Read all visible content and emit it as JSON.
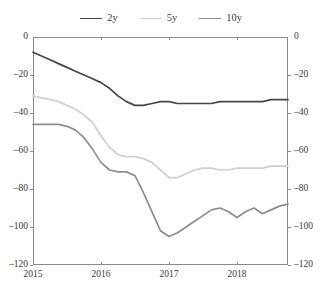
{
  "chart_data": {
    "type": "line",
    "title": "",
    "subtitle": "",
    "xlabel": "",
    "ylabel": "",
    "xlim": [
      2015.0,
      2018.75
    ],
    "ylim": [
      -120,
      0
    ],
    "yticks": [
      0,
      -20,
      -40,
      -60,
      -80,
      -100,
      -120
    ],
    "ytick_labels": [
      "0",
      "–20",
      "–40",
      "–60",
      "–80",
      "–100",
      "–120"
    ],
    "right_axis": true,
    "right_ytick_labels": [
      "0",
      "–20",
      "–40",
      "–60",
      "–80",
      "–100",
      "–120"
    ],
    "xticks": [
      2015,
      2016,
      2017,
      2018
    ],
    "xtick_labels": [
      "2015",
      "2016",
      "2017",
      "2018"
    ],
    "grid": false,
    "legend_position": "top-center",
    "x": [
      2015.0,
      2015.125,
      2015.25,
      2015.375,
      2015.5,
      2015.625,
      2015.75,
      2015.875,
      2016.0,
      2016.125,
      2016.25,
      2016.375,
      2016.5,
      2016.625,
      2016.75,
      2016.875,
      2017.0,
      2017.125,
      2017.25,
      2017.375,
      2017.5,
      2017.625,
      2017.75,
      2017.875,
      2018.0,
      2018.125,
      2018.25,
      2018.375,
      2018.5,
      2018.625,
      2018.75
    ],
    "series": [
      {
        "name": "2y",
        "color": "#474747",
        "width": 1.7,
        "values": [
          -8,
          -10,
          -12,
          -14,
          -16,
          -18,
          -20,
          -22,
          -24,
          -27,
          -31,
          -34,
          -36,
          -36,
          -35,
          -34,
          -34,
          -35,
          -35,
          -35,
          -35,
          -35,
          -34,
          -34,
          -34,
          -34,
          -34,
          -34,
          -33,
          -33,
          -33
        ]
      },
      {
        "name": "5y",
        "color": "#cfcfcf",
        "width": 1.7,
        "values": [
          -31,
          -32,
          -33,
          -34,
          -36,
          -38,
          -41,
          -45,
          -52,
          -58,
          -62,
          -63,
          -63,
          -64,
          -66,
          -70,
          -74,
          -74,
          -72,
          -70,
          -69,
          -69,
          -70,
          -70,
          -69,
          -69,
          -69,
          -69,
          -68,
          -68,
          -68
        ]
      },
      {
        "name": "10y",
        "color": "#8e8e8e",
        "width": 1.7,
        "values": [
          -46,
          -46,
          -46,
          -46,
          -47,
          -49,
          -53,
          -59,
          -66,
          -70,
          -71,
          -71,
          -73,
          -82,
          -92,
          -102,
          -105,
          -103,
          -100,
          -97,
          -94,
          -91,
          -90,
          -92,
          -95,
          -92,
          -90,
          -93,
          -91,
          -89,
          -88
        ]
      }
    ]
  },
  "legend": {
    "items": [
      {
        "label": "2y",
        "color": "#474747"
      },
      {
        "label": "5y",
        "color": "#cfcfcf"
      },
      {
        "label": "10y",
        "color": "#8e8e8e"
      }
    ]
  }
}
